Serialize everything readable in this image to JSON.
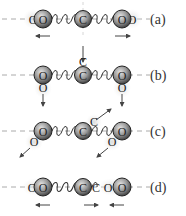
{
  "diagram": {
    "modes": [
      {
        "label": "(a)",
        "description": "symmetric stretch",
        "center_atom": "C",
        "outer_atoms": [
          "O",
          "O"
        ],
        "ghost_atoms": [
          "O",
          "O"
        ]
      },
      {
        "label": "(b)",
        "description": "bending",
        "center_atom": "C",
        "outer_atoms": [
          "O",
          "O"
        ],
        "ghost_atoms": [
          "C",
          "O",
          "O"
        ]
      },
      {
        "label": "(c)",
        "description": "bending (diagonal)",
        "center_atom": "C",
        "outer_atoms": [
          "O",
          "O"
        ],
        "ghost_atoms": [
          "C",
          "O",
          "O"
        ]
      },
      {
        "label": "(d)",
        "description": "asymmetric stretch",
        "center_atom": "C",
        "outer_atoms": [
          "O",
          "O"
        ],
        "ghost_atoms": [
          "O",
          "C",
          "O"
        ]
      }
    ],
    "colors": {
      "atom_dark": "#555555",
      "atom_light": "#d8d8d8",
      "spring": "#333333",
      "arrow": "#444444",
      "axis": "#aaaaaa"
    }
  }
}
